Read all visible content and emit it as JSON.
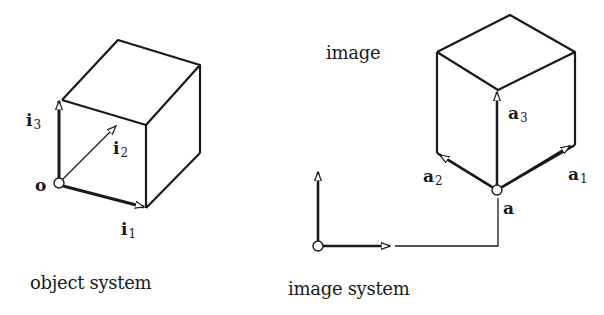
{
  "object_system": {
    "caption": "object system",
    "origin_label": "o",
    "vectors": [
      {
        "base": "i",
        "sub": "1"
      },
      {
        "base": "i",
        "sub": "2"
      },
      {
        "base": "i",
        "sub": "3"
      }
    ]
  },
  "image_system": {
    "caption": "image system",
    "image_label": "image",
    "origin_label": "a",
    "vectors": [
      {
        "base": "a",
        "sub": "1"
      },
      {
        "base": "a",
        "sub": "2"
      },
      {
        "base": "a",
        "sub": "3"
      }
    ]
  },
  "colors": {
    "line": "#1a1a1a",
    "background": "#ffffff"
  }
}
